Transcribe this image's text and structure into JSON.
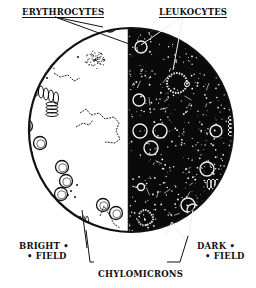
{
  "diagram": {
    "labels": {
      "erythrocytes": "ERYTHROCYTES",
      "leukocytes": "LEUKOCYTES",
      "chylomicrons": "CHYLOMICRONS",
      "bright_field_line1": "BRIGHT •",
      "bright_field_line2": "• FIELD",
      "dark_field_line1": "DARK •",
      "dark_field_line2": "• FIELD"
    },
    "panels": [
      {
        "name": "bright-field",
        "background": "#ffffff",
        "ink": "#111111"
      },
      {
        "name": "dark-field",
        "background": "#0a0a0a",
        "ink": "#f2f2f2"
      }
    ]
  }
}
